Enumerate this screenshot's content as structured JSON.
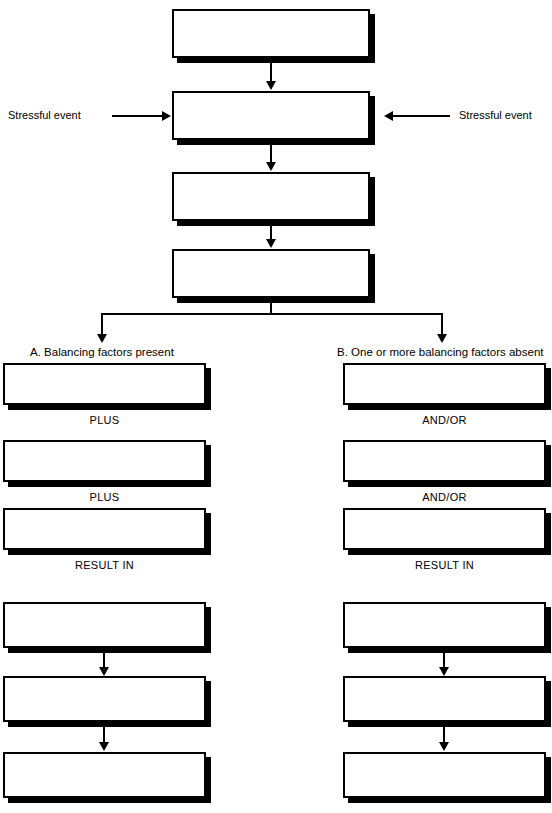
{
  "diagram": {
    "background_color": "#ffffff",
    "line_color": "#000000",
    "box_fill": "#ffffff",
    "shadow_color": "#000000",
    "spine": {
      "boxes": [
        {
          "id": "spine-box-1",
          "text": "",
          "x": 172,
          "y": 9,
          "w": 198,
          "h": 49
        },
        {
          "id": "spine-box-2",
          "text": "",
          "x": 172,
          "y": 91,
          "w": 198,
          "h": 49
        },
        {
          "id": "spine-box-3",
          "text": "",
          "x": 172,
          "y": 172,
          "w": 198,
          "h": 49
        },
        {
          "id": "spine-box-4",
          "text": "",
          "x": 172,
          "y": 249,
          "w": 198,
          "h": 49
        }
      ],
      "side_inputs": [
        {
          "id": "stressful-event-left",
          "label": "Stressful event",
          "side": "left"
        },
        {
          "id": "stressful-event-right",
          "label": "Stressful event",
          "side": "right"
        }
      ]
    },
    "branches": [
      {
        "id": "branch-a",
        "heading": "A. Balancing factors present",
        "column": "left",
        "boxes": [
          {
            "id": "a-box-1",
            "text": "",
            "y": 363,
            "h": 42
          },
          {
            "id": "a-box-2",
            "text": "",
            "y": 440,
            "h": 42
          },
          {
            "id": "a-box-3",
            "text": "",
            "y": 508,
            "h": 42
          },
          {
            "id": "a-box-4",
            "text": "",
            "y": 602,
            "h": 46
          },
          {
            "id": "a-box-5",
            "text": "",
            "y": 676,
            "h": 46
          },
          {
            "id": "a-box-6",
            "text": "",
            "y": 752,
            "h": 46
          }
        ],
        "connector_labels": [
          {
            "id": "a-conn-1",
            "text": "PLUS",
            "y": 413
          },
          {
            "id": "a-conn-2",
            "text": "PLUS",
            "y": 490
          },
          {
            "id": "a-conn-3",
            "text": "RESULT IN",
            "y": 558
          }
        ]
      },
      {
        "id": "branch-b",
        "heading": "B. One or more balancing factors absent",
        "column": "right",
        "boxes": [
          {
            "id": "b-box-1",
            "text": "",
            "y": 363,
            "h": 42
          },
          {
            "id": "b-box-2",
            "text": "",
            "y": 440,
            "h": 42
          },
          {
            "id": "b-box-3",
            "text": "",
            "y": 508,
            "h": 42
          },
          {
            "id": "b-box-4",
            "text": "",
            "y": 602,
            "h": 46
          },
          {
            "id": "b-box-5",
            "text": "",
            "y": 676,
            "h": 46
          },
          {
            "id": "b-box-6",
            "text": "",
            "y": 752,
            "h": 46
          }
        ],
        "connector_labels": [
          {
            "id": "b-conn-1",
            "text": "AND/OR",
            "y": 413
          },
          {
            "id": "b-conn-2",
            "text": "AND/OR",
            "y": 490
          },
          {
            "id": "b-conn-3",
            "text": "RESULT IN",
            "y": 558
          }
        ]
      }
    ]
  },
  "labels": {
    "stressful_event_left": "Stressful event",
    "stressful_event_right": "Stressful event",
    "heading_a": "A. Balancing factors present",
    "heading_b": "B. One or more balancing factors absent",
    "plus": "PLUS",
    "and_or": "AND/OR",
    "result_in": "RESULT IN"
  }
}
